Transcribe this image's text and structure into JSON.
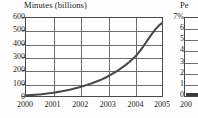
{
  "chart_data": [
    {
      "type": "line",
      "title": "Minutes (billions)",
      "xlabel": "",
      "ylabel": "",
      "x": [
        2000,
        2001,
        2002,
        2003,
        2004,
        2005
      ],
      "xtick_labels": [
        "2000",
        "2001",
        "2002",
        "2003",
        "2004",
        "2005"
      ],
      "ytick_labels": [
        "600",
        "500",
        "400",
        "300",
        "200",
        "100",
        "0"
      ],
      "ytick_values": [
        600,
        500,
        400,
        300,
        200,
        100,
        0
      ],
      "values": [
        5,
        25,
        70,
        150,
        300,
        560
      ],
      "series": [
        {
          "name": "Minutes (billions)",
          "values": [
            5,
            25,
            70,
            150,
            300,
            560
          ]
        }
      ],
      "xlim": [
        2000,
        2005
      ],
      "ylim": [
        0,
        600
      ],
      "grid": true,
      "legend": "none",
      "line_color": "#4a4a4a"
    },
    {
      "type": "bar",
      "title": "Pe",
      "title_truncated": true,
      "xtick_labels": [
        "200"
      ],
      "ytick_labels": [
        "7%",
        "6",
        "5",
        "4",
        "3",
        "2",
        "1",
        "0"
      ],
      "ytick_values": [
        7,
        6,
        5,
        4,
        3,
        2,
        1,
        0
      ],
      "values": [
        0.2
      ],
      "ylim": [
        0,
        7
      ],
      "grid": true,
      "legend": "none",
      "truncated": true,
      "bar_color": "#3a3a3a"
    }
  ],
  "main_chart": {
    "title": "Minutes (billions)",
    "y_ticks": [
      "600",
      "500",
      "400",
      "300",
      "200",
      "100",
      "0"
    ],
    "x_ticks": [
      "2000",
      "2001",
      "2002",
      "2003",
      "2004",
      "2005"
    ]
  },
  "partial_chart": {
    "title": "Pe",
    "y_ticks": [
      "7%",
      "6",
      "5",
      "4",
      "3",
      "2",
      "1",
      "0"
    ],
    "x_ticks": [
      "200"
    ]
  }
}
